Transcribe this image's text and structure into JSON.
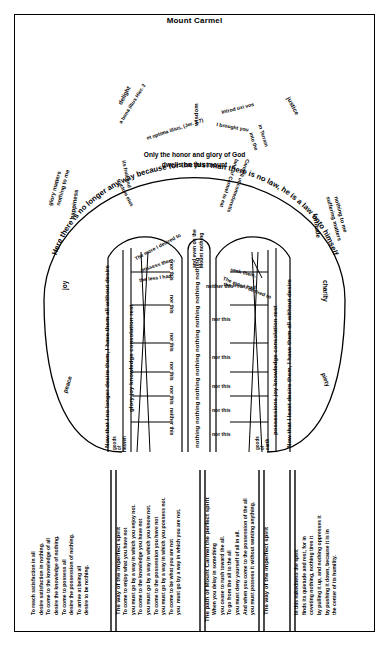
{
  "title": "Mount Carmel",
  "outer_arc": "Here there is no longer any way because for the just man there is no law, he is a law unto himself",
  "summit": {
    "center_line1": "Only the honor and glory of God",
    "center_line2": "dwells on this mount",
    "latin_left": "et optima illius, (Jer. 2,7)",
    "latin_left2": "a bona illius  Hier. 2",
    "latin_left3": "fructum eius",
    "latin_left4": "its fruit and",
    "latin_left5": "illius",
    "latin_right": "Introd uxi vos",
    "latin_right2": "I brought you",
    "latin_right3": "in Terram",
    "latin_right4": "land of Carmel to eat",
    "latin_right5": "Carmeli ut comederetis",
    "latin_right6": "into the"
  },
  "virtues": {
    "wisdom": "wisdom",
    "delight": "delight",
    "justice": "justice",
    "glory": "glory matters\nnothing to me",
    "suffering": "suffering matters\nnothing to me",
    "happiness": "happiness",
    "fortitude": "fortitude",
    "joy": "joy",
    "charity": "charity",
    "peace": "peace",
    "piety": "piety"
  },
  "left_path": {
    "cap": "The more I desired to\npossess them,\nthe less I had",
    "banner": "Now that I no longer desire them, I have them all without desire",
    "column_labels": "glory  joy  knowledge  consolation  rest",
    "goods": "goods\nof\nheaven",
    "rungs": [
      "nor this",
      "nor this",
      "nor this",
      "nor this",
      "nor this",
      "neither this"
    ]
  },
  "right_path": {
    "cap": "The more I desired to\nseek them,\nthe less I had",
    "banner": "Now that I least desire them, I have them all without desire",
    "column_labels": "possessions  joy  knowledge  consolation  rest",
    "goods": "goods\nof\nearth",
    "rungs": [
      "neither this",
      "nor this",
      "nor this",
      "nor this",
      "nor this",
      "nor this"
    ]
  },
  "center_path": {
    "top": "and even on the\nMount nothing",
    "repeats": "nothing nothing nothing nothing nothing nothing nothing nothing"
  },
  "bottom_panels": [
    {
      "heading": "",
      "lines": "To reach satisfaction in all\ndesire satisfaction in nothing.\nTo come to the knowledge of all\ndesire the knowledge of nothing.\nTo come to possess all\ndesire the possession of nothing.\nTo arrive at being all\ndesire to be nothing."
    },
    {
      "heading": "The way of the imperfect spirit",
      "lines": "To come to enjoy what you have not\nyou must go by a way in which you enjoy not.\nTo come to the knowledge you have not\nyou must go by a way in which you know not.\nTo come to the possession you have not\nyou must go by a way in which you possess not.\nTo come to be what you are not\nyou  must go by a way in which you are not."
    },
    {
      "heading": "The path of Mount Carmel the perfect spirit",
      "lines": "When you delay in something\nyou cease to rush toward the all.\nTo go from the all to the all\nyou must deny yourself of all in all.\nAnd when you come to the possession of the all\nyou must possess it without wanting anything."
    },
    {
      "heading": "The way of the imperfect spirit",
      "lines": "In this nakedness the spirit\nfinds its quietude and rest, for in\ncoveting nothing, nothing tires it\nby pulling it up, and nothing oppresses it\nby pushing it down, because it is in\nthe center of its humility."
    }
  ],
  "colors": {
    "ink": "#000000",
    "paper": "#ffffff"
  }
}
